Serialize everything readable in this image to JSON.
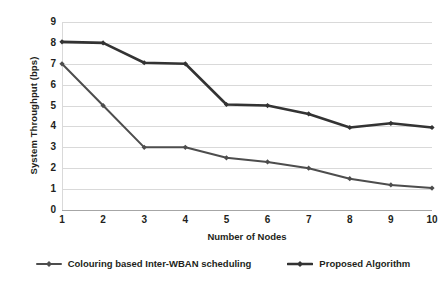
{
  "chart_data": {
    "type": "line",
    "title": "",
    "xlabel": "Number of Nodes",
    "ylabel": "System Throughput (bps)",
    "categories": [
      "1",
      "2",
      "3",
      "4",
      "5",
      "6",
      "7",
      "8",
      "9",
      "10"
    ],
    "x": [
      1,
      2,
      3,
      4,
      5,
      6,
      7,
      8,
      9,
      10
    ],
    "xlim": [
      1,
      10
    ],
    "ylim": [
      0,
      9
    ],
    "yticks": [
      "9",
      "8",
      "7",
      "6",
      "5",
      "4",
      "3",
      "2",
      "1",
      "0"
    ],
    "ytick_values": [
      9,
      8,
      7,
      6,
      5,
      4,
      3,
      2,
      1,
      0
    ],
    "grid": true,
    "grid_axis": "y",
    "legend_position": "bottom",
    "series": [
      {
        "name": "Colouring based Inter-WBAN scheduling",
        "values": [
          7,
          5,
          3,
          3,
          2.5,
          2.3,
          2,
          1.5,
          1.2,
          1.05
        ],
        "color": "#4d4d4d",
        "line_width": 2,
        "marker": "diamond"
      },
      {
        "name": "Proposed Algorithm",
        "values": [
          8.05,
          8,
          7.05,
          7,
          5.05,
          5,
          4.6,
          3.95,
          4.15,
          3.95
        ],
        "color": "#333333",
        "line_width": 2.6,
        "marker": "diamond"
      }
    ]
  },
  "legend": {
    "items": [
      {
        "label": "Colouring based Inter-WBAN scheduling"
      },
      {
        "label": "Proposed Algorithm"
      }
    ]
  }
}
